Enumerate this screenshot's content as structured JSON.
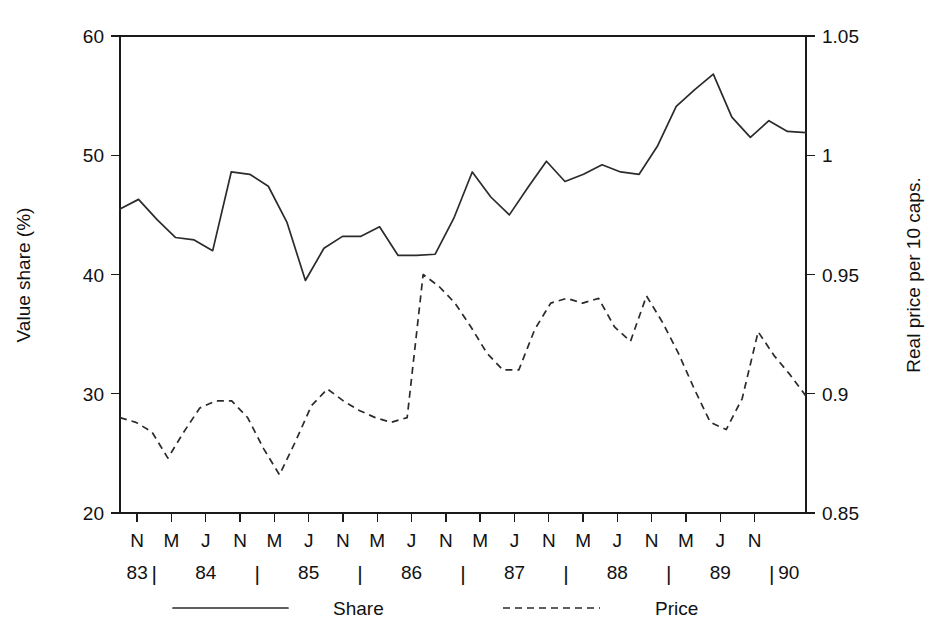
{
  "chart_data": {
    "type": "line",
    "title": "",
    "xlabel": "",
    "ylabel": "Value share (%)",
    "y2label": "Real price per 10 caps.",
    "ylim": [
      20,
      60
    ],
    "y2lim": [
      0.85,
      1.05
    ],
    "grid": false,
    "legend_position": "bottom",
    "y_ticks": [
      "20",
      "30",
      "40",
      "50",
      "60"
    ],
    "y_tick_values": [
      20,
      30,
      40,
      50,
      60
    ],
    "y2_ticks": [
      "0.85",
      "0.9",
      "0.95",
      "1",
      "1.05"
    ],
    "y2_tick_values": [
      0.85,
      0.9,
      0.95,
      1.0,
      1.05
    ],
    "x_month_labels": [
      "N",
      "M",
      "J",
      "N",
      "M",
      "J",
      "N",
      "M",
      "J",
      "N",
      "M",
      "J",
      "N",
      "M",
      "J",
      "N",
      "M",
      "J",
      "N"
    ],
    "x_years": [
      {
        "label": "83",
        "start_index": 0,
        "end_index": 0
      },
      {
        "label": "84",
        "start_index": 1,
        "end_index": 3
      },
      {
        "label": "85",
        "start_index": 4,
        "end_index": 6
      },
      {
        "label": "86",
        "start_index": 7,
        "end_index": 9
      },
      {
        "label": "87",
        "start_index": 10,
        "end_index": 12
      },
      {
        "label": "88",
        "start_index": 13,
        "end_index": 15
      },
      {
        "label": "89",
        "start_index": 16,
        "end_index": 18
      },
      {
        "label": "90",
        "start_index": 19,
        "end_index": 19
      }
    ],
    "series": [
      {
        "name": "Share",
        "style": "solid",
        "axis": "left",
        "color": "#2b2b2b",
        "values": [
          45.5,
          46.3,
          44.6,
          43.1,
          42.9,
          42.0,
          48.6,
          48.4,
          47.4,
          44.4,
          39.5,
          42.2,
          43.2,
          43.2,
          44.0,
          41.6,
          41.6,
          41.7,
          44.7,
          48.6,
          46.5,
          45.0,
          47.3,
          49.5,
          47.8,
          48.4,
          49.2,
          48.6,
          48.4,
          50.8,
          54.1,
          55.5,
          56.8,
          53.2,
          51.5,
          52.9,
          52.0,
          51.9
        ]
      },
      {
        "name": "Price",
        "style": "dashed",
        "axis": "right",
        "color": "#2b2b2b",
        "values": [
          0.89,
          0.888,
          0.884,
          0.873,
          0.884,
          0.894,
          0.897,
          0.897,
          0.89,
          0.877,
          0.866,
          0.88,
          0.895,
          0.902,
          0.897,
          0.893,
          0.89,
          0.888,
          0.89,
          0.95,
          0.945,
          0.938,
          0.928,
          0.917,
          0.91,
          0.91,
          0.927,
          0.938,
          0.94,
          0.938,
          0.94,
          0.928,
          0.922,
          0.941,
          0.93,
          0.917,
          0.902,
          0.888,
          0.885,
          0.898,
          0.926,
          0.916,
          0.908,
          0.899
        ]
      }
    ],
    "legend": [
      {
        "label": "Share",
        "style": "solid"
      },
      {
        "label": "Price",
        "style": "dashed"
      }
    ]
  }
}
